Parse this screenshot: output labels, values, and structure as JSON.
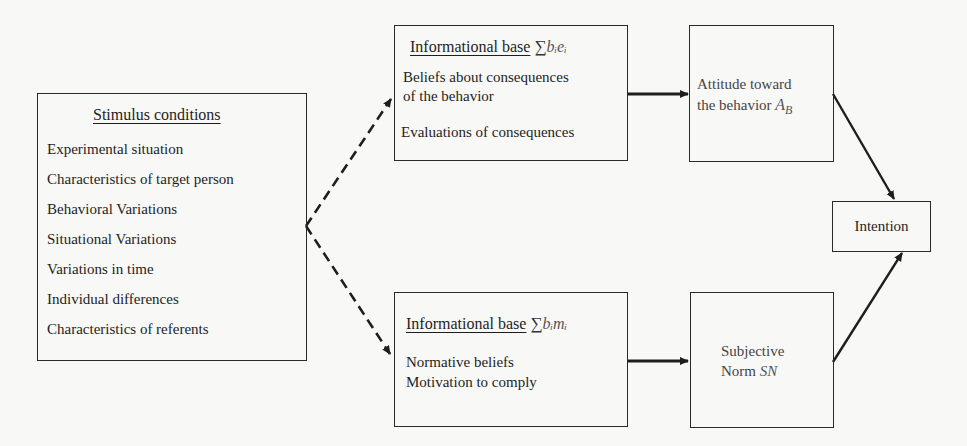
{
  "stimulus": {
    "title": "Stimulus conditions",
    "items": [
      "Experimental situation",
      "Characteristics of target person",
      "Behavioral Variations",
      "Situational Variations",
      "Variations in time",
      "Individual differences",
      "Characteristics of referents"
    ]
  },
  "info_attitude": {
    "title": "Informational base",
    "formula_sigma": "∑",
    "formula": "bᵢeᵢ",
    "lines": [
      "Beliefs about consequences",
      "of the behavior",
      "Evaluations of consequences"
    ]
  },
  "info_norm": {
    "title": "Informational base",
    "formula_sigma": "∑",
    "formula": "bᵢmᵢ",
    "lines": [
      "Normative beliefs",
      "Motivation to comply"
    ]
  },
  "attitude": {
    "line1": "Attitude toward",
    "line2": "the behavior",
    "symbol": "A",
    "symbol_sub": "B"
  },
  "norm": {
    "line1": "Subjective",
    "line2": "Norm",
    "symbol": "SN"
  },
  "intention": {
    "label": "Intention"
  },
  "edges": [
    {
      "from": "stimulus",
      "to": "info_attitude",
      "style": "dashed"
    },
    {
      "from": "stimulus",
      "to": "info_norm",
      "style": "dashed"
    },
    {
      "from": "info_attitude",
      "to": "attitude",
      "style": "solid"
    },
    {
      "from": "info_norm",
      "to": "norm",
      "style": "solid"
    },
    {
      "from": "attitude",
      "to": "intention",
      "style": "solid"
    },
    {
      "from": "norm",
      "to": "intention",
      "style": "solid"
    }
  ],
  "colors": {
    "background": "#f8f8f6",
    "stroke": "#1e1e1e"
  }
}
